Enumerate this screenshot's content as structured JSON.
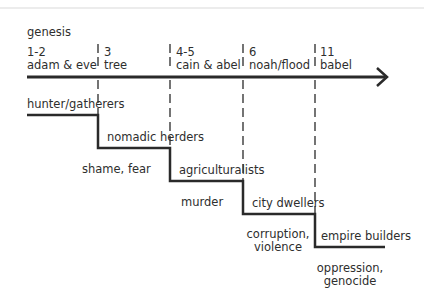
{
  "title": "genesis",
  "timeline": {
    "markers": [
      {
        "chapter": "1-2",
        "label": "adam & eve"
      },
      {
        "chapter": "3",
        "label": "tree"
      },
      {
        "chapter": "4-5",
        "label": "cain & abel"
      },
      {
        "chapter": "6",
        "label": "noah/flood"
      },
      {
        "chapter": "11",
        "label": "babel"
      }
    ]
  },
  "stages": [
    {
      "name": "hunter/gatherers"
    },
    {
      "name": "nomadic herders",
      "consequence": "shame, fear"
    },
    {
      "name": "agriculturalists",
      "consequence": "murder"
    },
    {
      "name": "city dwellers",
      "consequence_line1": "corruption,",
      "consequence_line2": "violence"
    },
    {
      "name": "empire builders",
      "consequence_line1": "oppression,",
      "consequence_line2": "genocide"
    }
  ],
  "colors": {
    "line": "#2a2a2a",
    "text": "#2e2e2e"
  }
}
